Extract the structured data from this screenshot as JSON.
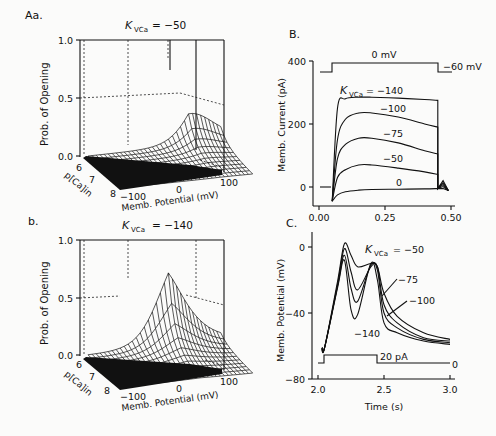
{
  "figure": {
    "panels": {
      "Aa": {
        "label": "Aa.",
        "title_prefix": "K",
        "title_sub": "VCa",
        "title_value": "= −50",
        "kvca": -50,
        "ylabel": "Prob. of Opening",
        "yticks": [
          "1.0",
          "0.5",
          "0.0"
        ],
        "depth_label": "p[Ca]in",
        "depth_ticks": [
          "6",
          "7",
          "8"
        ],
        "xlabel": "Memb. Potential (mV)",
        "xticks": [
          "−100",
          "0",
          "100"
        ]
      },
      "b": {
        "label": "b.",
        "title_prefix": "K",
        "title_sub": "VCa",
        "title_value": "= −140",
        "kvca": -140,
        "ylabel": "Prob. of Opening",
        "yticks": [
          "1.0",
          "0.5",
          "0.0"
        ],
        "depth_label": "p[Ca]in",
        "depth_ticks": [
          "6",
          "7",
          "8"
        ],
        "xlabel": "Memb. Potential (mV)",
        "xticks": [
          "−100",
          "0",
          "100"
        ]
      },
      "B": {
        "label": "B.",
        "ylabel": "Memb. Current (pA)",
        "yticks": [
          "400",
          "200",
          "0"
        ],
        "xticks": [
          "0.00",
          "0.25",
          "0.50"
        ],
        "step_high_label": "0 mV",
        "step_low_label": "−60 mV",
        "kvca_label_prefix": "K",
        "kvca_label_sub": "VCa",
        "curve_labels": [
          "= −140",
          "−100",
          "−75",
          "−50",
          "0"
        ]
      },
      "C": {
        "label": "C.",
        "ylabel": "Memb. Potential (mV)",
        "yticks": [
          "0",
          "−40",
          "−80"
        ],
        "xticks": [
          "2.0",
          "2.5",
          "3.0"
        ],
        "xlabel": "Time (s)",
        "stim_label": "20 pA",
        "stim_zero_label": "0",
        "kvca_label_prefix": "K",
        "kvca_label_sub": "VCa",
        "curve_labels": [
          "= −50",
          "−75",
          "−100",
          "−140"
        ]
      }
    }
  },
  "chart_data": [
    {
      "type": "surface",
      "panel": "Aa",
      "title": "K_VCa = -50",
      "xlabel": "Memb. Potential (mV)",
      "ylabel": "p[Ca]in",
      "zlabel": "Prob. of Opening",
      "x_range": [
        -100,
        100
      ],
      "y_range": [
        6,
        8
      ],
      "z_range": [
        0,
        1
      ],
      "description": "Open probability rises steeply with depolarization; peak approx 0.75 near +50 mV at pCa 6, near zero at pCa 8"
    },
    {
      "type": "surface",
      "panel": "b",
      "title": "K_VCa = -140",
      "xlabel": "Memb. Potential (mV)",
      "ylabel": "p[Ca]in",
      "zlabel": "Prob. of Opening",
      "x_range": [
        -100,
        100
      ],
      "y_range": [
        6,
        8
      ],
      "z_range": [
        0,
        1
      ],
      "description": "Sigmoidal surface reaching ~1.0 at positive potentials for pCa 6; shifted to left relative to K_VCa=-50"
    },
    {
      "type": "line",
      "panel": "B",
      "xlabel": "Time (s)",
      "ylabel": "Memb. Current (pA)",
      "xlim": [
        0.0,
        0.5
      ],
      "ylim": [
        -60,
        400
      ],
      "voltage_step": {
        "holding_mV": -60,
        "step_mV": 0,
        "on_s": 0.05,
        "off_s": 0.45
      },
      "x": [
        0.05,
        0.07,
        0.1,
        0.15,
        0.2,
        0.3,
        0.4,
        0.45
      ],
      "series": [
        {
          "name": "K_VCa = -140",
          "values": [
            -45,
            250,
            280,
            285,
            285,
            282,
            278,
            275
          ]
        },
        {
          "name": "K_VCa = -100",
          "values": [
            -45,
            150,
            215,
            235,
            235,
            222,
            200,
            190
          ]
        },
        {
          "name": "K_VCa = -75",
          "values": [
            -45,
            90,
            135,
            155,
            155,
            140,
            115,
            105
          ]
        },
        {
          "name": "K_VCa = -50",
          "values": [
            -45,
            30,
            55,
            70,
            70,
            60,
            48,
            40
          ]
        },
        {
          "name": "K_VCa = 0",
          "values": [
            -45,
            -25,
            -15,
            -10,
            -8,
            -7,
            -6,
            -5
          ]
        }
      ]
    },
    {
      "type": "line",
      "panel": "C",
      "xlabel": "Time (s)",
      "ylabel": "Memb. Potential (mV)",
      "xlim": [
        2.0,
        3.0
      ],
      "ylim": [
        -80,
        10
      ],
      "current_step": {
        "amplitude_pA": 20,
        "on_s": 2.05,
        "off_s": 2.45
      },
      "x": [
        2.05,
        2.15,
        2.2,
        2.25,
        2.3,
        2.4,
        2.45,
        2.5,
        2.6,
        2.8,
        3.0
      ],
      "series": [
        {
          "name": "K_VCa = -50",
          "values": [
            -61,
            -20,
            2,
            -5,
            -12,
            -10,
            -12,
            -28,
            -42,
            -52,
            -56
          ]
        },
        {
          "name": "K_VCa = -75",
          "values": [
            -61,
            -22,
            -1,
            -15,
            -26,
            -12,
            -12,
            -35,
            -46,
            -55,
            -57
          ]
        },
        {
          "name": "K_VCa = -100",
          "values": [
            -61,
            -23,
            -5,
            -25,
            -33,
            -11,
            -14,
            -40,
            -49,
            -56,
            -58
          ]
        },
        {
          "name": "K_VCa = -140",
          "values": [
            -61,
            -24,
            -8,
            -38,
            -41,
            -10,
            -20,
            -46,
            -52,
            -57,
            -59
          ]
        }
      ]
    }
  ]
}
